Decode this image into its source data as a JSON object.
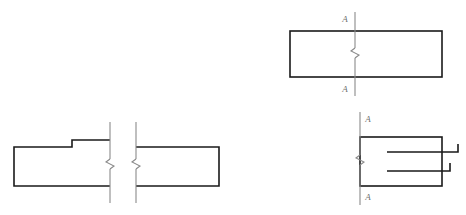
{
  "sheet": {
    "width": 466,
    "height": 215,
    "background": "#ffffff",
    "outline_color": "#1a1a1a",
    "thin_line_color": "#8a8a8a",
    "label_color": "#6f6f6f",
    "top_text_remnant": "                                                                      "
  },
  "figures": {
    "top_right_section": {
      "name": "Sectioned rectangle with cutting-plane line A-A",
      "rect": {
        "x": 290,
        "y": 31,
        "width": 152,
        "height": 46
      },
      "section_line": {
        "x": 355,
        "y_top": 12,
        "y_bottom": 96
      },
      "break_jog": {
        "center_x": 355,
        "center_y": 54,
        "amplitude": 4,
        "height": 12
      },
      "label_top": "A",
      "label_top_pos": {
        "x": 345,
        "y": 22
      },
      "label_bottom": "A",
      "label_bottom_pos": {
        "x": 345,
        "y": 92
      }
    },
    "bottom_left_broken": {
      "name": "Stepped profile shown as a broken view",
      "outline_left": [
        [
          110,
          140
        ],
        [
          72,
          140
        ],
        [
          72,
          147
        ],
        [
          14,
          147
        ],
        [
          14,
          186
        ],
        [
          110,
          186
        ]
      ],
      "outline_right": [
        [
          136,
          147
        ],
        [
          219,
          147
        ],
        [
          219,
          186
        ],
        [
          136,
          186
        ]
      ],
      "break_line_left": {
        "x": 110,
        "y_top": 122,
        "y_bottom": 203
      },
      "break_jog_left": {
        "center_x": 110,
        "center_y": 165,
        "amplitude": 4,
        "height": 12
      },
      "break_line_right": {
        "x": 136,
        "y_top": 122,
        "y_bottom": 203
      },
      "break_jog_right": {
        "center_x": 136,
        "center_y": 165,
        "amplitude": 4,
        "height": 12
      }
    },
    "bottom_right_section": {
      "name": "Rectangle with cutting-plane line A-A and two hooked leader lines",
      "rect": {
        "x": 360,
        "y": 137,
        "width": 82,
        "height": 49
      },
      "section_line": {
        "x": 360,
        "y_top": 112,
        "y_bottom": 205
      },
      "break_jog": {
        "center_x": 360,
        "center_y": 161,
        "amplitude": 4,
        "height": 12
      },
      "label_top": "A",
      "label_top_pos": {
        "x": 364,
        "y": 122
      },
      "label_bottom": "A",
      "label_bottom_pos": {
        "x": 364,
        "y": 199
      },
      "hook_lines": [
        {
          "x_start": 387,
          "x_end": 458,
          "y": 152,
          "hook_height": 8
        },
        {
          "x_start": 387,
          "x_end": 450,
          "y": 171,
          "hook_height": 8
        }
      ]
    }
  }
}
